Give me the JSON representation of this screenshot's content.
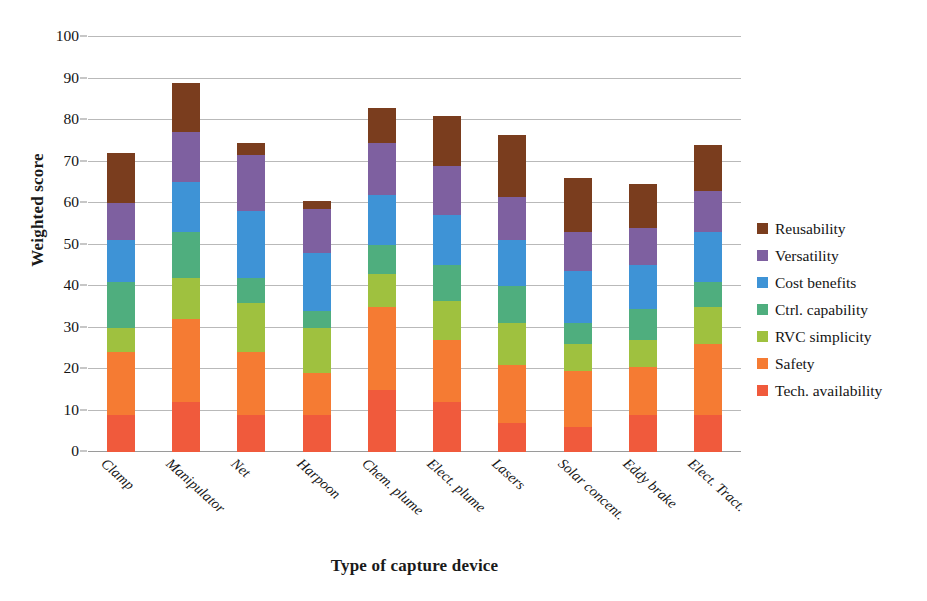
{
  "chart_data": {
    "type": "bar",
    "subtype": "stacked-bar",
    "title": "",
    "xlabel": "Type of capture device",
    "ylabel": "Weighted score",
    "ylim": [
      0,
      100
    ],
    "yticks": [
      0,
      10,
      20,
      30,
      40,
      50,
      60,
      70,
      80,
      90,
      100
    ],
    "ytick_labels": [
      "0",
      "10",
      "20",
      "30",
      "40",
      "50",
      "60",
      "70",
      "80",
      "90",
      "100"
    ],
    "grid": true,
    "legend_position": "right",
    "categories": [
      "Clamp",
      "Manipulator",
      "Net",
      "Harpoon",
      "Chem. plume",
      "Elect. plume",
      "Lasers",
      "Solar concent.",
      "Eddy brake",
      "Elect. Tract."
    ],
    "series": [
      {
        "name": "Tech. availability",
        "color": "#F05A3C",
        "values": [
          9.0,
          12.0,
          9.0,
          9.0,
          15.0,
          12.0,
          7.0,
          6.0,
          9.0,
          9.0
        ]
      },
      {
        "name": "Safety",
        "color": "#F57B33",
        "values": [
          15.0,
          20.0,
          15.0,
          10.0,
          20.0,
          15.0,
          14.0,
          13.5,
          11.5,
          17.0
        ]
      },
      {
        "name": "RVC simplicity",
        "color": "#9FC13F",
        "values": [
          6.0,
          10.0,
          12.0,
          11.0,
          8.0,
          9.5,
          10.0,
          6.5,
          6.5,
          9.0
        ]
      },
      {
        "name": "Ctrl. capability",
        "color": "#4FAE7E",
        "values": [
          11.0,
          11.0,
          6.0,
          4.0,
          7.0,
          8.5,
          9.0,
          5.0,
          7.5,
          6.0
        ]
      },
      {
        "name": "Cost benefits",
        "color": "#3E93D6",
        "values": [
          10.0,
          12.0,
          16.0,
          14.0,
          12.0,
          12.0,
          11.0,
          12.5,
          10.5,
          12.0
        ]
      },
      {
        "name": "Versatility",
        "color": "#7E60A0",
        "values": [
          9.0,
          12.0,
          13.5,
          10.5,
          12.5,
          12.0,
          10.5,
          9.5,
          9.0,
          10.0
        ]
      },
      {
        "name": "Reusability",
        "color": "#7A3D1E",
        "values": [
          12.0,
          12.0,
          3.0,
          2.0,
          8.5,
          12.0,
          15.0,
          13.0,
          10.5,
          11.0
        ]
      }
    ],
    "totals": [
      72.0,
      89.0,
      74.5,
      60.5,
      83.0,
      81.0,
      76.5,
      66.0,
      64.5,
      74.0
    ],
    "legend_order_top_to_bottom": [
      "Reusability",
      "Versatility",
      "Cost benefits",
      "Ctrl. capability",
      "RVC simplicity",
      "Safety",
      "Tech. availability"
    ]
  }
}
